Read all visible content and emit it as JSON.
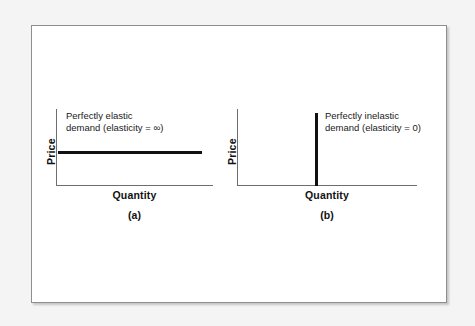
{
  "figure": {
    "background_color": "#f4f4f4",
    "card_color": "#ffffff",
    "border_color": "#8e8e8e",
    "axis_color": "#6e6e6e",
    "curve_color": "#111111"
  },
  "chart_data": {
    "type": "line",
    "title": "",
    "panels": [
      {
        "id": "a",
        "caption": "(a)",
        "xlabel": "Quantity",
        "ylabel": "Price",
        "annotation_line1": "Perfectly elastic",
        "annotation_line2": "demand (elasticity = ∞)",
        "curve_name": "perfectly-elastic-demand",
        "orientation": "horizontal",
        "elasticity": "infinity",
        "description": "A horizontal demand curve at a single constant price; quantity demanded varies without limit at that price.",
        "series": [
          {
            "name": "Perfectly elastic demand",
            "x": [
              0,
              100
            ],
            "y": [
              50,
              50
            ]
          }
        ],
        "xlim": [
          0,
          110
        ],
        "ylim": [
          0,
          100
        ],
        "grid": false,
        "ticks": []
      },
      {
        "id": "b",
        "caption": "(b)",
        "xlabel": "Quantity",
        "ylabel": "Price",
        "annotation_line1": "Perfectly inelastic",
        "annotation_line2": "demand (elasticity = 0)",
        "curve_name": "perfectly-inelastic-demand",
        "orientation": "vertical",
        "elasticity": "0",
        "description": "A vertical demand curve at a single fixed quantity; quantity demanded does not respond to price.",
        "series": [
          {
            "name": "Perfectly inelastic demand",
            "x": [
              45,
              45
            ],
            "y": [
              0,
              100
            ]
          }
        ],
        "xlim": [
          0,
          110
        ],
        "ylim": [
          0,
          100
        ],
        "grid": false,
        "ticks": []
      }
    ],
    "xlabel": "Quantity",
    "ylabel": "Price",
    "legend": [],
    "legend_position": "none"
  }
}
